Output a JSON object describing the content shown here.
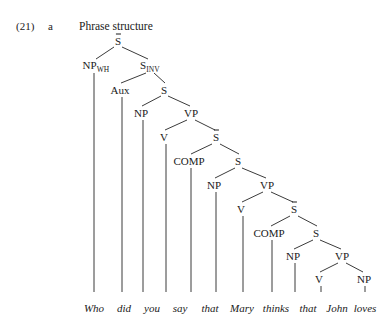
{
  "figure": {
    "example_number": "(21)",
    "example_letter": "a",
    "caption": "Phrase structure",
    "sentence": "Who did you say that Mary thinks that John loves ø",
    "line_color": "#3b3b3b",
    "text_color": "#1a1a1a",
    "background_color": "#ffffff"
  },
  "terminals": [
    {
      "word": "Who",
      "x": 94,
      "y": 303
    },
    {
      "word": "did",
      "x": 124,
      "y": 303
    },
    {
      "word": "you",
      "x": 152,
      "y": 303
    },
    {
      "word": "say",
      "x": 180,
      "y": 303
    },
    {
      "word": "that",
      "x": 210,
      "y": 303
    },
    {
      "word": "Mary",
      "x": 242,
      "y": 303
    },
    {
      "word": "thinks",
      "x": 276,
      "y": 303
    },
    {
      "word": "that",
      "x": 308,
      "y": 303
    },
    {
      "word": "John",
      "x": 337,
      "y": 303
    },
    {
      "word": "loves",
      "x": 365,
      "y": 303
    },
    {
      "word": "ø",
      "x": 394,
      "y": 303
    }
  ],
  "nodes": [
    {
      "label": "S",
      "overbar": true,
      "sub": "",
      "x": 118,
      "y": 41
    },
    {
      "label": "NP",
      "overbar": false,
      "sub": "WH",
      "x": 96,
      "y": 66
    },
    {
      "label": "S",
      "overbar": false,
      "sub": "INV",
      "x": 150,
      "y": 66
    },
    {
      "label": "Aux",
      "overbar": false,
      "sub": "",
      "x": 120,
      "y": 90
    },
    {
      "label": "S",
      "overbar": false,
      "sub": "",
      "x": 164,
      "y": 90
    },
    {
      "label": "NP",
      "overbar": false,
      "sub": "",
      "x": 141,
      "y": 113
    },
    {
      "label": "VP",
      "overbar": false,
      "sub": "",
      "x": 191,
      "y": 113
    },
    {
      "label": "V",
      "overbar": false,
      "sub": "",
      "x": 164,
      "y": 137
    },
    {
      "label": "S",
      "overbar": true,
      "sub": "",
      "x": 216,
      "y": 137
    },
    {
      "label": "COMP",
      "overbar": false,
      "sub": "",
      "x": 189,
      "y": 161
    },
    {
      "label": "S",
      "overbar": false,
      "sub": "",
      "x": 238,
      "y": 161
    },
    {
      "label": "NP",
      "overbar": false,
      "sub": "",
      "x": 214,
      "y": 185
    },
    {
      "label": "VP",
      "overbar": false,
      "sub": "",
      "x": 267,
      "y": 185
    },
    {
      "label": "V",
      "overbar": false,
      "sub": "",
      "x": 241,
      "y": 209
    },
    {
      "label": "S",
      "overbar": true,
      "sub": "",
      "x": 294,
      "y": 209
    },
    {
      "label": "COMP",
      "overbar": false,
      "sub": "",
      "x": 269,
      "y": 233
    },
    {
      "label": "S",
      "overbar": false,
      "sub": "",
      "x": 316,
      "y": 233
    },
    {
      "label": "NP",
      "overbar": false,
      "sub": "",
      "x": 293,
      "y": 256
    },
    {
      "label": "VP",
      "overbar": false,
      "sub": "",
      "x": 342,
      "y": 256
    },
    {
      "label": "V",
      "overbar": false,
      "sub": "",
      "x": 319,
      "y": 279
    },
    {
      "label": "NP",
      "overbar": false,
      "sub": "",
      "x": 364,
      "y": 279
    }
  ],
  "branches": [
    {
      "from": "S-bar-root",
      "to": "NP-WH",
      "x1": 114,
      "y1": 47,
      "x2": 96,
      "y2": 59
    },
    {
      "from": "S-bar-root",
      "to": "S-INV",
      "x1": 122,
      "y1": 47,
      "x2": 148,
      "y2": 59
    },
    {
      "from": "S-INV",
      "to": "Aux",
      "x1": 146,
      "y1": 73,
      "x2": 121,
      "y2": 83
    },
    {
      "from": "S-INV",
      "to": "S1",
      "x1": 154,
      "y1": 73,
      "x2": 165,
      "y2": 83
    },
    {
      "from": "S1",
      "to": "NP1",
      "x1": 161,
      "y1": 96,
      "x2": 142,
      "y2": 106
    },
    {
      "from": "S1",
      "to": "VP1",
      "x1": 168,
      "y1": 96,
      "x2": 190,
      "y2": 106
    },
    {
      "from": "VP1",
      "to": "V1",
      "x1": 187,
      "y1": 120,
      "x2": 165,
      "y2": 130
    },
    {
      "from": "VP1",
      "to": "S-bar-1",
      "x1": 195,
      "y1": 120,
      "x2": 215,
      "y2": 130
    },
    {
      "from": "S-bar-1",
      "to": "COMP1",
      "x1": 212,
      "y1": 144,
      "x2": 191,
      "y2": 154
    },
    {
      "from": "S-bar-1",
      "to": "S2",
      "x1": 220,
      "y1": 144,
      "x2": 239,
      "y2": 154
    },
    {
      "from": "S2",
      "to": "NP2",
      "x1": 235,
      "y1": 168,
      "x2": 215,
      "y2": 178
    },
    {
      "from": "S2",
      "to": "VP2",
      "x1": 242,
      "y1": 168,
      "x2": 266,
      "y2": 178
    },
    {
      "from": "VP2",
      "to": "V2",
      "x1": 263,
      "y1": 192,
      "x2": 242,
      "y2": 202
    },
    {
      "from": "VP2",
      "to": "S-bar-2",
      "x1": 271,
      "y1": 192,
      "x2": 293,
      "y2": 202
    },
    {
      "from": "S-bar-2",
      "to": "COMP2",
      "x1": 290,
      "y1": 216,
      "x2": 271,
      "y2": 226
    },
    {
      "from": "S-bar-2",
      "to": "S3",
      "x1": 298,
      "y1": 216,
      "x2": 317,
      "y2": 226
    },
    {
      "from": "S3",
      "to": "NP3",
      "x1": 313,
      "y1": 240,
      "x2": 294,
      "y2": 249
    },
    {
      "from": "S3",
      "to": "VP3",
      "x1": 320,
      "y1": 240,
      "x2": 341,
      "y2": 249
    },
    {
      "from": "VP3",
      "to": "V3",
      "x1": 338,
      "y1": 263,
      "x2": 320,
      "y2": 272
    },
    {
      "from": "VP3",
      "to": "NP4",
      "x1": 346,
      "y1": 263,
      "x2": 363,
      "y2": 272
    }
  ],
  "stems": [
    {
      "from": "NP-WH",
      "word": "Who",
      "x": 94,
      "y1": 73,
      "y2": 292
    },
    {
      "from": "Aux",
      "word": "did",
      "x": 122,
      "y1": 97,
      "y2": 292
    },
    {
      "from": "NP1",
      "word": "you",
      "x": 143,
      "y1": 120,
      "y2": 292
    },
    {
      "from": "V1",
      "word": "say",
      "x": 166,
      "y1": 144,
      "y2": 292
    },
    {
      "from": "COMP1",
      "word": "that",
      "x": 191,
      "y1": 168,
      "y2": 292
    },
    {
      "from": "NP2",
      "word": "Mary",
      "x": 216,
      "y1": 192,
      "y2": 292
    },
    {
      "from": "V2",
      "word": "thinks",
      "x": 243,
      "y1": 216,
      "y2": 292
    },
    {
      "from": "COMP2",
      "word": "that",
      "x": 272,
      "y1": 240,
      "y2": 292
    },
    {
      "from": "NP3",
      "word": "John",
      "x": 295,
      "y1": 263,
      "y2": 292
    },
    {
      "from": "V3",
      "word": "loves",
      "x": 321,
      "y1": 286,
      "y2": 292
    },
    {
      "from": "NP4",
      "word": "ø",
      "x": 365,
      "y1": 286,
      "y2": 292
    }
  ]
}
